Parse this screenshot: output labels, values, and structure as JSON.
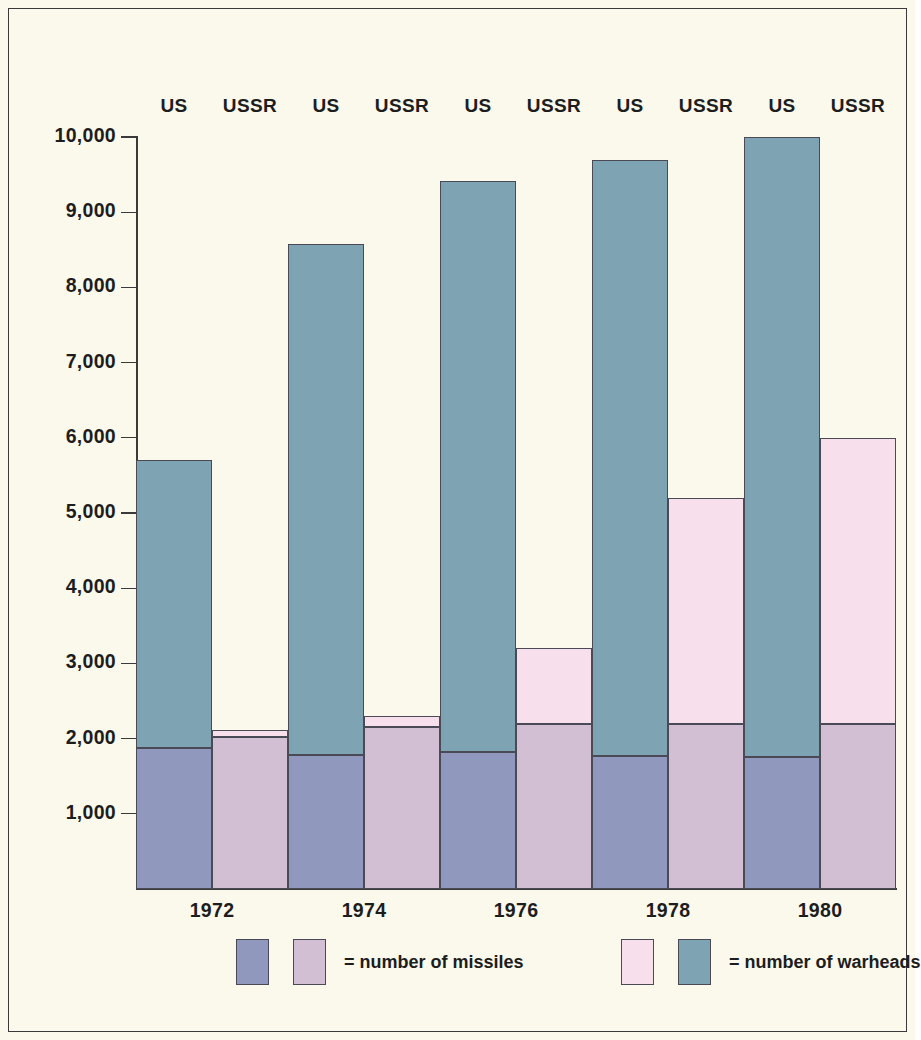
{
  "chart_data": {
    "type": "bar",
    "title": "",
    "subtitle": "",
    "xlabel": "",
    "ylabel": "",
    "ylim": [
      0,
      10000
    ],
    "ytick_values": [
      1000,
      2000,
      3000,
      4000,
      5000,
      6000,
      7000,
      8000,
      9000,
      10000
    ],
    "ytick_labels": [
      "1,000",
      "2,000",
      "3,000",
      "4,000",
      "5,000",
      "6,000",
      "7,000",
      "8,000",
      "9,000",
      "10,000"
    ],
    "grid": false,
    "stacked": true,
    "categories": [
      "1972",
      "1974",
      "1976",
      "1978",
      "1980"
    ],
    "column_headers": [
      "US",
      "USSR",
      "US",
      "USSR",
      "US",
      "USSR",
      "US",
      "USSR",
      "US",
      "USSR"
    ],
    "series": [
      {
        "name": "number of missiles",
        "country": "US",
        "values": [
          1870,
          1780,
          1820,
          1770,
          1760
        ]
      },
      {
        "name": "number of warheads",
        "country": "US",
        "values": [
          5700,
          8580,
          9420,
          9700,
          10000
        ]
      },
      {
        "name": "number of missiles",
        "country": "USSR",
        "values": [
          2020,
          2150,
          2200,
          2200,
          2200
        ]
      },
      {
        "name": "number of warheads",
        "country": "USSR",
        "values": [
          2120,
          2300,
          3200,
          5200,
          6000
        ]
      }
    ],
    "colors": {
      "missiles_us": "#9098bd",
      "warheads_us": "#7ea3b3",
      "missiles_ussr": "#d3bfd4",
      "warheads_ussr": "#f7dfeb",
      "background": "#fbf9ec",
      "axis": "#3a3a3a",
      "text": "#1d1d1d"
    },
    "legend": {
      "position": "bottom",
      "entries": [
        {
          "label": "= number of missiles",
          "swatches": [
            "#9098bd",
            "#d3bfd4"
          ]
        },
        {
          "label": "= number of warheads",
          "swatches": [
            "#f7dfeb",
            "#7ea3b3"
          ]
        }
      ]
    }
  },
  "axis": {
    "ticks": [
      {
        "label": "10,000",
        "value": 10000
      },
      {
        "label": "9,000",
        "value": 9000
      },
      {
        "label": "8,000",
        "value": 8000
      },
      {
        "label": "7,000",
        "value": 7000
      },
      {
        "label": "6,000",
        "value": 6000
      },
      {
        "label": "5,000",
        "value": 5000
      },
      {
        "label": "4,000",
        "value": 4000
      },
      {
        "label": "3,000",
        "value": 3000
      },
      {
        "label": "2,000",
        "value": 2000
      },
      {
        "label": "1,000",
        "value": 1000
      }
    ]
  },
  "headers": [
    {
      "label": "US"
    },
    {
      "label": "USSR"
    },
    {
      "label": "US"
    },
    {
      "label": "USSR"
    },
    {
      "label": "US"
    },
    {
      "label": "USSR"
    },
    {
      "label": "US"
    },
    {
      "label": "USSR"
    },
    {
      "label": "US"
    },
    {
      "label": "USSR"
    }
  ],
  "years": [
    {
      "label": "1972"
    },
    {
      "label": "1974"
    },
    {
      "label": "1976"
    },
    {
      "label": "1978"
    },
    {
      "label": "1980"
    }
  ],
  "legend": {
    "missiles_label": "= number of missiles",
    "warheads_label": "= number of warheads"
  }
}
